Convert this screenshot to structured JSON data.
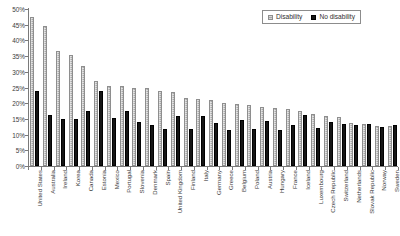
{
  "legend": {
    "position": "top-right",
    "entries": [
      {
        "label": "Disability",
        "color": "#a8a8a8",
        "icon": "legend-swatch-hatched"
      },
      {
        "label": "No disability",
        "color": "#151515",
        "icon": "legend-swatch-solid"
      }
    ]
  },
  "chart_data": {
    "type": "bar",
    "title": "",
    "xlabel": "",
    "ylabel": "",
    "ylim": [
      0,
      50
    ],
    "ytick_labels": [
      "0%",
      "5%",
      "10%",
      "15%",
      "20%",
      "25%",
      "30%",
      "35%",
      "40%",
      "45%",
      "50%"
    ],
    "ytick_values": [
      0,
      5,
      10,
      15,
      20,
      25,
      30,
      35,
      40,
      45,
      50
    ],
    "grid": false,
    "legend_position": "top-right",
    "categories": [
      "United States",
      "Australia",
      "Ireland",
      "Korea",
      "Canada",
      "Estonia",
      "Mexico",
      "Portugal",
      "Slovenia",
      "Denmark",
      "Spain",
      "United Kingdom",
      "Finland",
      "Italy",
      "Germany",
      "Greece",
      "Belgium",
      "Poland",
      "Austria",
      "Hungary",
      "France",
      "Iceland",
      "Luxembourg",
      "Czech Republic",
      "Switzerland",
      "Netherlands",
      "Slovak Republic",
      "Norway",
      "Sweden"
    ],
    "series": [
      {
        "name": "Disability",
        "color": "#a8a8a8",
        "values": [
          47.5,
          44.7,
          36.6,
          35.4,
          32.0,
          27.0,
          25.5,
          25.5,
          25.0,
          24.8,
          24.0,
          23.7,
          21.6,
          21.4,
          21.0,
          20.2,
          19.6,
          19.3,
          18.8,
          18.5,
          18.0,
          17.4,
          16.6,
          16.0,
          15.6,
          13.6,
          13.4,
          12.9,
          12.6
        ]
      },
      {
        "name": "No disability",
        "color": "#151515",
        "values": [
          24.0,
          16.4,
          14.9,
          14.9,
          17.4,
          23.8,
          15.2,
          17.5,
          13.9,
          13.2,
          11.9,
          15.9,
          11.9,
          15.8,
          13.7,
          11.4,
          14.6,
          11.7,
          14.3,
          11.5,
          13.0,
          16.1,
          12.1,
          13.9,
          13.3,
          13.0,
          13.3,
          12.3,
          13.1
        ]
      }
    ]
  }
}
